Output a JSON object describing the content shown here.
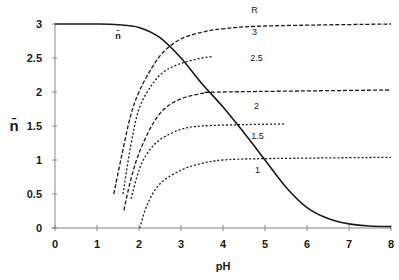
{
  "chart_data": {
    "type": "line",
    "title": "",
    "xlabel": "pH",
    "ylabel": "n̄",
    "xlim": [
      0,
      8
    ],
    "ylim": [
      0,
      3
    ],
    "grid": false,
    "legend": "none (inline labels)",
    "x_ticks": [
      "0",
      "1",
      "2",
      "3",
      "4",
      "5",
      "6",
      "7",
      "8"
    ],
    "y_ticks": [
      "0",
      "0.5",
      "1",
      "1.5",
      "2",
      "2.5",
      "3"
    ],
    "annotations": [
      {
        "text": "R",
        "x": 4.75,
        "y": 3.2
      },
      {
        "text": "n̄",
        "x": 1.5,
        "y": 2.83
      }
    ],
    "series": [
      {
        "name": "n̄",
        "style": "solid",
        "label": "n̄",
        "points": [
          [
            0,
            3
          ],
          [
            1,
            3
          ],
          [
            1.5,
            2.99
          ],
          [
            2.0,
            2.95
          ],
          [
            2.5,
            2.8
          ],
          [
            3.0,
            2.5
          ],
          [
            3.5,
            2.12
          ],
          [
            4.0,
            1.78
          ],
          [
            4.5,
            1.4
          ],
          [
            5.0,
            1.0
          ],
          [
            5.5,
            0.6
          ],
          [
            6.0,
            0.3
          ],
          [
            6.5,
            0.14
          ],
          [
            7.0,
            0.06
          ],
          [
            7.5,
            0.03
          ],
          [
            8.0,
            0.02
          ]
        ]
      },
      {
        "name": "R = 3",
        "style": "dashed",
        "label": "3",
        "label_pos": [
          4.75,
          2.88
        ],
        "points": [
          [
            1.4,
            0.5
          ],
          [
            1.6,
            1.1
          ],
          [
            1.8,
            1.65
          ],
          [
            2.0,
            2.0
          ],
          [
            2.3,
            2.35
          ],
          [
            2.6,
            2.6
          ],
          [
            3.0,
            2.78
          ],
          [
            3.5,
            2.88
          ],
          [
            4.0,
            2.93
          ],
          [
            5.0,
            2.97
          ],
          [
            8.0,
            3.0
          ]
        ]
      },
      {
        "name": "R = 2.5",
        "style": "dotted",
        "label": "2.5",
        "label_pos": [
          4.8,
          2.5
        ],
        "points": [
          [
            1.62,
            0.5
          ],
          [
            1.8,
            1.2
          ],
          [
            2.0,
            1.75
          ],
          [
            2.3,
            2.1
          ],
          [
            2.6,
            2.3
          ],
          [
            3.0,
            2.42
          ],
          [
            3.5,
            2.5
          ],
          [
            3.75,
            2.52
          ]
        ]
      },
      {
        "name": "R = 2",
        "style": "dashed",
        "label": "2",
        "label_pos": [
          4.8,
          1.79
        ],
        "points": [
          [
            1.64,
            0.26
          ],
          [
            1.8,
            0.7
          ],
          [
            2.0,
            1.1
          ],
          [
            2.3,
            1.5
          ],
          [
            2.6,
            1.75
          ],
          [
            3.0,
            1.9
          ],
          [
            3.5,
            1.98
          ],
          [
            4.0,
            2.0
          ],
          [
            8.0,
            2.03
          ]
        ]
      },
      {
        "name": "R = 1.5",
        "style": "dotted",
        "label": "1.5",
        "label_pos": [
          4.82,
          1.35
        ],
        "points": [
          [
            1.81,
            0.43
          ],
          [
            2.0,
            0.85
          ],
          [
            2.2,
            1.1
          ],
          [
            2.5,
            1.3
          ],
          [
            3.0,
            1.45
          ],
          [
            3.5,
            1.5
          ],
          [
            4.5,
            1.52
          ],
          [
            5.5,
            1.53
          ]
        ]
      },
      {
        "name": "R = 1",
        "style": "dotted",
        "label": "1",
        "label_pos": [
          4.82,
          0.85
        ],
        "points": [
          [
            2.02,
            0
          ],
          [
            2.2,
            0.35
          ],
          [
            2.5,
            0.65
          ],
          [
            3.0,
            0.85
          ],
          [
            3.5,
            0.95
          ],
          [
            4.0,
            1.0
          ],
          [
            5.0,
            1.02
          ],
          [
            8.0,
            1.04
          ]
        ]
      }
    ]
  },
  "colors": {
    "axis": "#888888",
    "line": "#1a1a1a",
    "background": "#ffffff"
  }
}
